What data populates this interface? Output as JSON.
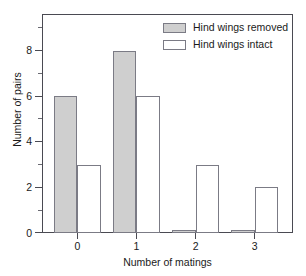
{
  "chart_data": {
    "type": "bar",
    "title": "",
    "subtitle": "",
    "xlabel": "Number of matings",
    "ylabel": "Number of pairs",
    "categories": [
      "0",
      "1",
      "2",
      "3"
    ],
    "series": [
      {
        "name": "Hind wings removed",
        "values": [
          6,
          8,
          0.15,
          0.15
        ],
        "swatch": "filled",
        "color": "#cfcfcf"
      },
      {
        "name": "Hind wings intact",
        "values": [
          3,
          6,
          3,
          2
        ],
        "swatch": "open",
        "color": "#ffffff"
      }
    ],
    "ylim": [
      0,
      9.6
    ],
    "xlim": [
      -0.6,
      3.65
    ],
    "y_major_ticks": [
      0,
      2,
      4,
      6,
      8
    ],
    "y_minor_ticks": [
      1,
      3,
      5,
      7,
      9
    ],
    "y_tick_labels": [
      "0",
      "2",
      "4",
      "6",
      "8"
    ],
    "x_tick_labels": [
      "0",
      "1",
      "2",
      "3"
    ],
    "grid": false,
    "legend_position": "upper-right",
    "legend_entries": [
      "Hind wings removed",
      "Hind wings intact"
    ],
    "frame_color": "#4a4a52",
    "bar_edge_color": "#7b7b85"
  },
  "axes": {
    "y_title": "Number of pairs",
    "x_title": "Number of matings"
  }
}
